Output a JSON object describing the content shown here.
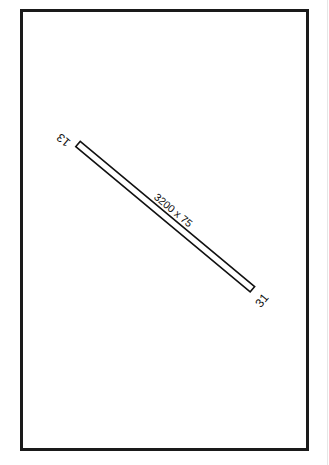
{
  "diagram": {
    "type": "airport-runway-diagram",
    "colors": {
      "stroke": "#111111",
      "background": "#ffffff",
      "frame": "#1a1a1a"
    },
    "runway": {
      "dimensions_label": "3200 x 75",
      "end_a": {
        "label": "13"
      },
      "end_b": {
        "label": "31"
      }
    }
  }
}
